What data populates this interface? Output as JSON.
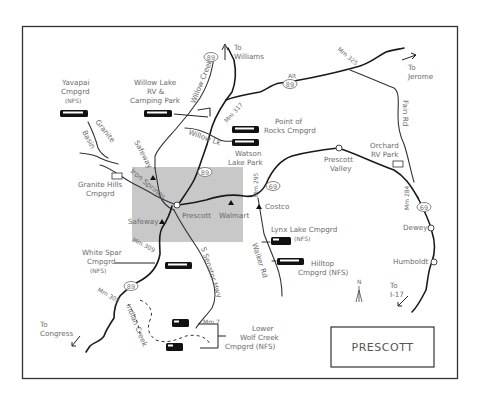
{
  "map": {
    "title": "PRESCOTT",
    "colors": {
      "background": "#ffffff",
      "border": "#333333",
      "shaded_area": "#c8c8c8",
      "roads": "#1a1a1a",
      "labels": "#6a6a6a"
    },
    "highway_shields": [
      {
        "id": "hwy89-north",
        "label": "89"
      },
      {
        "id": "hwy89a",
        "label": "89",
        "prefix": "Alt"
      },
      {
        "id": "hwy89-center",
        "label": "89"
      },
      {
        "id": "hwy69",
        "label": "69"
      },
      {
        "id": "hwy69-east",
        "label": "69"
      },
      {
        "id": "hwy89-south",
        "label": "89"
      }
    ],
    "directions": [
      {
        "id": "to-williams",
        "line1": "To",
        "line2": "Williams"
      },
      {
        "id": "to-jerome",
        "line1": "To",
        "line2": "Jerome"
      },
      {
        "id": "to-i17",
        "line1": "To",
        "line2": "I-17"
      },
      {
        "id": "to-congress",
        "line1": "To",
        "line2": "Congress"
      }
    ],
    "campgrounds": [
      {
        "id": "yavapai",
        "lines": [
          "Yavapai",
          "Cmpgrd",
          "(NFS)"
        ]
      },
      {
        "id": "willow-lake",
        "lines": [
          "Willow Lake",
          "RV &",
          "Camping Park"
        ]
      },
      {
        "id": "point-of-rocks",
        "lines": [
          "Point of",
          "Rocks Cmpgrd"
        ]
      },
      {
        "id": "watson-lake",
        "lines": [
          "Watson",
          "Lake Park"
        ]
      },
      {
        "id": "granite-hills",
        "lines": [
          "Granite Hills",
          "Cmpgrd"
        ]
      },
      {
        "id": "orchard-rv",
        "lines": [
          "Orchard",
          "RV Park"
        ]
      },
      {
        "id": "lynx-lake",
        "lines": [
          "Lynx Lake Cmpgrd",
          "(NFS)"
        ]
      },
      {
        "id": "hilltop",
        "lines": [
          "Hilltop",
          "Cmpgrd (NFS)"
        ]
      },
      {
        "id": "white-spar",
        "lines": [
          "White Spar",
          "Cmpgrd",
          "(NFS)"
        ]
      },
      {
        "id": "lower-wolf-creek",
        "lines": [
          "Lower",
          "Wolf Creek",
          "Cmpgrd (NFS)"
        ]
      }
    ],
    "towns": [
      {
        "id": "prescott",
        "label": "Prescott"
      },
      {
        "id": "prescott-valley",
        "lines": [
          "Prescott",
          "Valley"
        ]
      },
      {
        "id": "dewey",
        "label": "Dewey"
      },
      {
        "id": "humboldt",
        "label": "Humboldt"
      }
    ],
    "stores": [
      {
        "id": "safeway-north",
        "label": "Safeway"
      },
      {
        "id": "safeway-south",
        "label": "Safeway"
      },
      {
        "id": "walmart",
        "label": "Walmart"
      },
      {
        "id": "costco",
        "label": "Costco"
      }
    ],
    "roads": [
      {
        "id": "willow-creek",
        "label": "Willow Creek"
      },
      {
        "id": "willow-lk",
        "label": "Willow Lk"
      },
      {
        "id": "granite-basin",
        "label": "Granite Basin"
      },
      {
        "id": "iron-springs",
        "label": "Iron Springs"
      },
      {
        "id": "s-senator-hwy",
        "label": "S Senator Hwy"
      },
      {
        "id": "walker-rd",
        "label": "Walker Rd"
      },
      {
        "id": "fain-rd",
        "label": "Fain Rd"
      },
      {
        "id": "indian-creek",
        "label": "Indian Creek"
      }
    ],
    "mileposts": [
      {
        "id": "mm317",
        "label": "Mm 317"
      },
      {
        "id": "mm325",
        "label": "Mm 325"
      },
      {
        "id": "mm295",
        "label": "Mm 295"
      },
      {
        "id": "mm284",
        "label": "Mm 284"
      },
      {
        "id": "mm309",
        "label": "Mm 309"
      },
      {
        "id": "mm305",
        "label": "Mm 305"
      },
      {
        "id": "mm7",
        "label": "Mm 7"
      }
    ],
    "compass": {
      "label": "N"
    }
  }
}
